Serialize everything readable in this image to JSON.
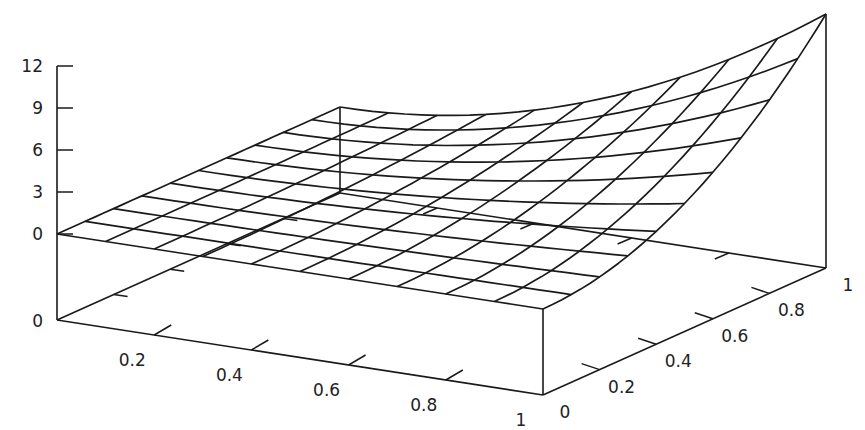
{
  "chart_data": {
    "type": "surface3d",
    "title": "",
    "function_estimate": "z = 12 * x^2 * y^2",
    "x": [
      0,
      0.1,
      0.2,
      0.3,
      0.4,
      0.5,
      0.6,
      0.7,
      0.8,
      0.9,
      1
    ],
    "y": [
      0,
      0.1,
      0.2,
      0.3,
      0.4,
      0.5,
      0.6,
      0.7,
      0.8,
      0.9,
      1
    ],
    "corner_values": {
      "x0_y0": 0,
      "x1_y0": 0,
      "x0_y1": 0,
      "x1_y1": 12
    },
    "xlabel": "",
    "ylabel": "",
    "zlabel": "",
    "xlim": [
      0,
      1
    ],
    "ylim": [
      0,
      1
    ],
    "zlim": [
      0,
      12
    ],
    "grid_divisions": 10,
    "x_ticks": [
      {
        "value": 0.2,
        "label": "0.2"
      },
      {
        "value": 0.4,
        "label": "0.4"
      },
      {
        "value": 0.6,
        "label": "0.6"
      },
      {
        "value": 0.8,
        "label": "0.8"
      },
      {
        "value": 1,
        "label": "1"
      }
    ],
    "y_ticks": [
      {
        "value": 0,
        "label": "0"
      },
      {
        "value": 0.2,
        "label": "0.2"
      },
      {
        "value": 0.4,
        "label": "0.4"
      },
      {
        "value": 0.6,
        "label": "0.6"
      },
      {
        "value": 0.8,
        "label": "0.8"
      },
      {
        "value": 1,
        "label": "1"
      }
    ],
    "z_ticks": [
      {
        "value": 0,
        "label": "0"
      },
      {
        "value": 3,
        "label": "3"
      },
      {
        "value": 6,
        "label": "6"
      },
      {
        "value": 9,
        "label": "9"
      },
      {
        "value": 12,
        "label": "12"
      }
    ],
    "floor_label": "0",
    "legend": null,
    "grid_on": false
  },
  "projection": {
    "origin": [
      57,
      320
    ],
    "x_vec": [
      486,
      75
    ],
    "y_vec": [
      283,
      -127
    ],
    "z_base_offset": 86,
    "z_px_per_unit": 14
  },
  "colors": {
    "line": "#1a1a1a",
    "background": "#ffffff",
    "text": "#222222"
  }
}
